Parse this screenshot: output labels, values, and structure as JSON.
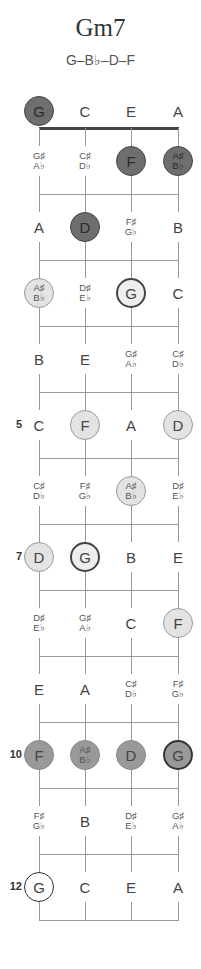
{
  "chord": {
    "name": "Gm7",
    "notes": "G–B♭–D–F"
  },
  "strings": [
    "G",
    "C",
    "E",
    "A"
  ],
  "fret_numbers": [
    {
      "fret": 5,
      "label": "5"
    },
    {
      "fret": 7,
      "label": "7"
    },
    {
      "fret": 10,
      "label": "10"
    },
    {
      "fret": 12,
      "label": "12"
    }
  ],
  "positions": [
    {
      "fret": 0,
      "string": 0,
      "label": "G",
      "style": "dark"
    },
    {
      "fret": 0,
      "string": 1,
      "label": "C",
      "style": "none"
    },
    {
      "fret": 0,
      "string": 2,
      "label": "E",
      "style": "none"
    },
    {
      "fret": 0,
      "string": 3,
      "label": "A",
      "style": "none"
    },
    {
      "fret": 1,
      "string": 0,
      "label": "G♯/A♭",
      "style": "none"
    },
    {
      "fret": 1,
      "string": 1,
      "label": "C♯/D♭",
      "style": "none"
    },
    {
      "fret": 1,
      "string": 2,
      "label": "F",
      "style": "dark"
    },
    {
      "fret": 1,
      "string": 3,
      "label": "A♯/B♭",
      "style": "dark"
    },
    {
      "fret": 2,
      "string": 0,
      "label": "A",
      "style": "none"
    },
    {
      "fret": 2,
      "string": 1,
      "label": "D",
      "style": "dark"
    },
    {
      "fret": 2,
      "string": 2,
      "label": "F♯/G♭",
      "style": "none"
    },
    {
      "fret": 2,
      "string": 3,
      "label": "B",
      "style": "none"
    },
    {
      "fret": 3,
      "string": 0,
      "label": "A♯/B♭",
      "style": "light"
    },
    {
      "fret": 3,
      "string": 1,
      "label": "D♯/E♭",
      "style": "none"
    },
    {
      "fret": 3,
      "string": 2,
      "label": "G",
      "style": "ring"
    },
    {
      "fret": 3,
      "string": 3,
      "label": "C",
      "style": "none"
    },
    {
      "fret": 4,
      "string": 0,
      "label": "B",
      "style": "none"
    },
    {
      "fret": 4,
      "string": 1,
      "label": "E",
      "style": "none"
    },
    {
      "fret": 4,
      "string": 2,
      "label": "G♯/A♭",
      "style": "none"
    },
    {
      "fret": 4,
      "string": 3,
      "label": "C♯/D♭",
      "style": "none"
    },
    {
      "fret": 5,
      "string": 0,
      "label": "C",
      "style": "none"
    },
    {
      "fret": 5,
      "string": 1,
      "label": "F",
      "style": "light"
    },
    {
      "fret": 5,
      "string": 2,
      "label": "A",
      "style": "none"
    },
    {
      "fret": 5,
      "string": 3,
      "label": "D",
      "style": "light"
    },
    {
      "fret": 6,
      "string": 0,
      "label": "C♯/D♭",
      "style": "none"
    },
    {
      "fret": 6,
      "string": 1,
      "label": "F♯/G♭",
      "style": "none"
    },
    {
      "fret": 6,
      "string": 2,
      "label": "A♯/B♭",
      "style": "light"
    },
    {
      "fret": 6,
      "string": 3,
      "label": "D♯/E♭",
      "style": "none"
    },
    {
      "fret": 7,
      "string": 0,
      "label": "D",
      "style": "light"
    },
    {
      "fret": 7,
      "string": 1,
      "label": "G",
      "style": "ring"
    },
    {
      "fret": 7,
      "string": 2,
      "label": "B",
      "style": "none"
    },
    {
      "fret": 7,
      "string": 3,
      "label": "E",
      "style": "none"
    },
    {
      "fret": 8,
      "string": 0,
      "label": "D♯/E♭",
      "style": "none"
    },
    {
      "fret": 8,
      "string": 1,
      "label": "G♯/A♭",
      "style": "none"
    },
    {
      "fret": 8,
      "string": 2,
      "label": "C",
      "style": "none"
    },
    {
      "fret": 8,
      "string": 3,
      "label": "F",
      "style": "light"
    },
    {
      "fret": 9,
      "string": 0,
      "label": "E",
      "style": "none"
    },
    {
      "fret": 9,
      "string": 1,
      "label": "A",
      "style": "none"
    },
    {
      "fret": 9,
      "string": 2,
      "label": "C♯/D♭",
      "style": "none"
    },
    {
      "fret": 9,
      "string": 3,
      "label": "F♯/G♭",
      "style": "none"
    },
    {
      "fret": 10,
      "string": 0,
      "label": "F",
      "style": "mid"
    },
    {
      "fret": 10,
      "string": 1,
      "label": "A♯/B♭",
      "style": "mid"
    },
    {
      "fret": 10,
      "string": 2,
      "label": "D",
      "style": "mid"
    },
    {
      "fret": 10,
      "string": 3,
      "label": "G",
      "style": "midring"
    },
    {
      "fret": 11,
      "string": 0,
      "label": "F♯/G♭",
      "style": "none"
    },
    {
      "fret": 11,
      "string": 1,
      "label": "B",
      "style": "none"
    },
    {
      "fret": 11,
      "string": 2,
      "label": "D♯/E♭",
      "style": "none"
    },
    {
      "fret": 11,
      "string": 3,
      "label": "G♯/A♭",
      "style": "none"
    },
    {
      "fret": 12,
      "string": 0,
      "label": "G",
      "style": "ringw"
    },
    {
      "fret": 12,
      "string": 1,
      "label": "C",
      "style": "none"
    },
    {
      "fret": 12,
      "string": 2,
      "label": "E",
      "style": "none"
    },
    {
      "fret": 12,
      "string": 3,
      "label": "A",
      "style": "none"
    }
  ]
}
